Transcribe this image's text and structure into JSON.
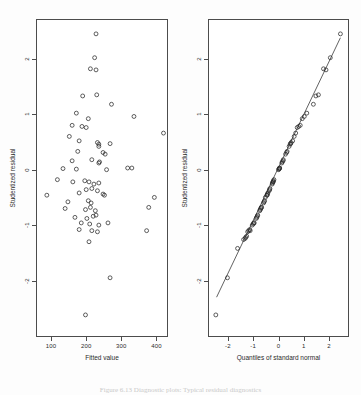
{
  "figure": {
    "caption": "Figure 6.13  Diagnostic plots: Typical residual diagnostics"
  },
  "chart_data": [
    {
      "type": "scatter",
      "panel": "left",
      "title": "",
      "xlabel": "Fitted value",
      "ylabel": "Studentized residual",
      "xlim": [
        60,
        430
      ],
      "ylim": [
        -3.0,
        2.7
      ],
      "xticks": [
        100,
        200,
        300,
        400
      ],
      "yticks": [
        2,
        1,
        0,
        -1,
        -2
      ],
      "xticklabels": [
        "100",
        "200",
        "300",
        "400"
      ],
      "yticklabels": [
        "2",
        "1",
        "0",
        "-1",
        "-2"
      ],
      "grid": false,
      "legend": null,
      "marker": "open-circle",
      "points": [
        [
          228,
          2.45
        ],
        [
          224,
          2.02
        ],
        [
          212,
          1.82
        ],
        [
          228,
          1.8
        ],
        [
          190,
          1.33
        ],
        [
          230,
          1.35
        ],
        [
          272,
          1.18
        ],
        [
          172,
          1.02
        ],
        [
          336,
          0.96
        ],
        [
          206,
          0.92
        ],
        [
          160,
          0.8
        ],
        [
          188,
          0.78
        ],
        [
          200,
          0.76
        ],
        [
          420,
          0.66
        ],
        [
          152,
          0.6
        ],
        [
          180,
          0.52
        ],
        [
          232,
          0.49
        ],
        [
          236,
          0.46
        ],
        [
          236,
          0.42
        ],
        [
          268,
          0.47
        ],
        [
          176,
          0.33
        ],
        [
          248,
          0.31
        ],
        [
          254,
          0.28
        ],
        [
          160,
          0.16
        ],
        [
          216,
          0.18
        ],
        [
          238,
          0.14
        ],
        [
          236,
          0.12
        ],
        [
          134,
          0.02
        ],
        [
          172,
          0.01
        ],
        [
          258,
          0.0
        ],
        [
          318,
          0.03
        ],
        [
          330,
          0.03
        ],
        [
          118,
          -0.18
        ],
        [
          162,
          -0.22
        ],
        [
          196,
          -0.2
        ],
        [
          208,
          -0.22
        ],
        [
          222,
          -0.26
        ],
        [
          236,
          -0.24
        ],
        [
          200,
          -0.36
        ],
        [
          216,
          -0.34
        ],
        [
          232,
          -0.38
        ],
        [
          88,
          -0.46
        ],
        [
          180,
          -0.42
        ],
        [
          248,
          -0.44
        ],
        [
          252,
          -0.46
        ],
        [
          148,
          -0.58
        ],
        [
          206,
          -0.56
        ],
        [
          214,
          -0.6
        ],
        [
          394,
          -0.5
        ],
        [
          140,
          -0.7
        ],
        [
          198,
          -0.72
        ],
        [
          212,
          -0.68
        ],
        [
          226,
          -0.74
        ],
        [
          378,
          -0.68
        ],
        [
          168,
          -0.86
        ],
        [
          202,
          -0.88
        ],
        [
          220,
          -0.84
        ],
        [
          228,
          -0.82
        ],
        [
          186,
          -0.96
        ],
        [
          210,
          -0.98
        ],
        [
          236,
          -1.0
        ],
        [
          262,
          -0.96
        ],
        [
          180,
          -1.08
        ],
        [
          216,
          -1.1
        ],
        [
          232,
          -1.12
        ],
        [
          372,
          -1.1
        ],
        [
          208,
          -1.3
        ],
        [
          268,
          -1.95
        ],
        [
          198,
          -2.62
        ]
      ]
    },
    {
      "type": "scatter",
      "panel": "right",
      "title": "",
      "xlabel": "Quantiles of standard normal",
      "ylabel": "Studentized residual",
      "xlim": [
        -2.75,
        2.75
      ],
      "ylim": [
        -3.0,
        2.7
      ],
      "xticks": [
        -2,
        -1,
        0,
        1,
        2
      ],
      "yticks": [
        2,
        1,
        0,
        -1,
        -2
      ],
      "xticklabels": [
        "-2",
        "-1",
        "0",
        "1",
        "2"
      ],
      "yticklabels": [
        "2",
        "1",
        "0",
        "-1",
        "-2"
      ],
      "grid": false,
      "legend": null,
      "marker": "open-circle",
      "reference_line": {
        "x1": -2.45,
        "y1": -2.3,
        "x2": 2.45,
        "y2": 2.38
      },
      "points": [
        [
          2.45,
          2.45
        ],
        [
          2.05,
          2.02
        ],
        [
          1.78,
          1.82
        ],
        [
          1.88,
          1.8
        ],
        [
          1.48,
          1.33
        ],
        [
          1.58,
          1.35
        ],
        [
          1.38,
          1.18
        ],
        [
          1.12,
          1.02
        ],
        [
          1.02,
          0.96
        ],
        [
          0.94,
          0.92
        ],
        [
          0.86,
          0.8
        ],
        [
          0.8,
          0.78
        ],
        [
          0.74,
          0.76
        ],
        [
          0.68,
          0.66
        ],
        [
          0.62,
          0.6
        ],
        [
          0.56,
          0.52
        ],
        [
          0.5,
          0.49
        ],
        [
          0.46,
          0.46
        ],
        [
          0.42,
          0.42
        ],
        [
          0.48,
          0.47
        ],
        [
          0.34,
          0.33
        ],
        [
          0.32,
          0.31
        ],
        [
          0.28,
          0.28
        ],
        [
          0.18,
          0.16
        ],
        [
          0.19,
          0.18
        ],
        [
          0.15,
          0.14
        ],
        [
          0.13,
          0.12
        ],
        [
          0.03,
          0.02
        ],
        [
          0.02,
          0.01
        ],
        [
          0.0,
          0.0
        ],
        [
          0.04,
          0.03
        ],
        [
          0.05,
          0.03
        ],
        [
          -0.18,
          -0.18
        ],
        [
          -0.21,
          -0.22
        ],
        [
          -0.2,
          -0.2
        ],
        [
          -0.22,
          -0.22
        ],
        [
          -0.25,
          -0.26
        ],
        [
          -0.24,
          -0.24
        ],
        [
          -0.35,
          -0.36
        ],
        [
          -0.34,
          -0.34
        ],
        [
          -0.37,
          -0.38
        ],
        [
          -0.45,
          -0.46
        ],
        [
          -0.42,
          -0.42
        ],
        [
          -0.44,
          -0.44
        ],
        [
          -0.46,
          -0.46
        ],
        [
          -0.57,
          -0.58
        ],
        [
          -0.55,
          -0.56
        ],
        [
          -0.59,
          -0.6
        ],
        [
          -0.52,
          -0.5
        ],
        [
          -0.7,
          -0.7
        ],
        [
          -0.72,
          -0.72
        ],
        [
          -0.68,
          -0.68
        ],
        [
          -0.74,
          -0.74
        ],
        [
          -0.67,
          -0.68
        ],
        [
          -0.86,
          -0.86
        ],
        [
          -0.88,
          -0.88
        ],
        [
          -0.84,
          -0.84
        ],
        [
          -0.82,
          -0.82
        ],
        [
          -0.98,
          -0.96
        ],
        [
          -1.0,
          -0.98
        ],
        [
          -1.04,
          -1.0
        ],
        [
          -0.96,
          -0.96
        ],
        [
          -1.14,
          -1.08
        ],
        [
          -1.18,
          -1.1
        ],
        [
          -1.22,
          -1.12
        ],
        [
          -1.12,
          -1.1
        ],
        [
          -1.32,
          -1.24
        ],
        [
          -1.3,
          -1.22
        ],
        [
          -1.26,
          -1.2
        ],
        [
          -1.38,
          -1.26
        ],
        [
          -1.62,
          -1.42
        ],
        [
          -2.02,
          -1.95
        ],
        [
          -2.48,
          -2.62
        ]
      ]
    }
  ]
}
